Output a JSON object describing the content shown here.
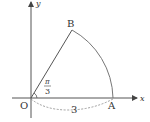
{
  "diagram": {
    "axes": {
      "x_label": "x",
      "y_label": "y",
      "origin_label": "O"
    },
    "points": {
      "A": {
        "label": "A",
        "coord": [
          3,
          0
        ]
      },
      "B": {
        "label": "B",
        "polar": {
          "r": 3,
          "theta": "π/3"
        }
      }
    },
    "angle_label": {
      "numerator": "π",
      "denominator": "3"
    },
    "radius_label": "3",
    "colors": {
      "line": "#555555",
      "arc": "#777777",
      "text": "#333333"
    }
  }
}
